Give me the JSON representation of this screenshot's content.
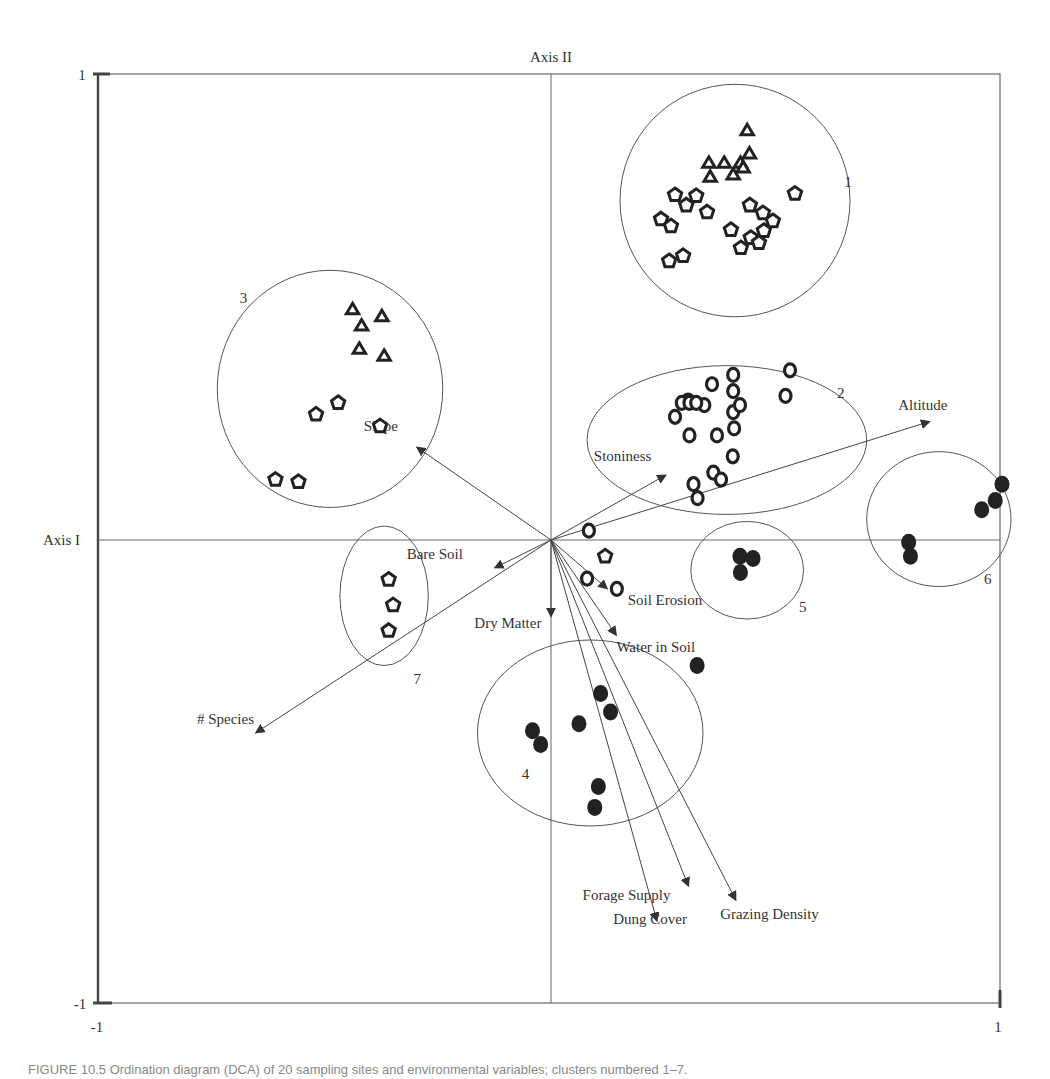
{
  "chart_data": {
    "type": "scatter",
    "title": "",
    "xlabel": "Axis I",
    "ylabel": "Axis II",
    "xlim": [
      -1,
      1
    ],
    "ylim": [
      -1,
      1
    ],
    "grid": false,
    "legend": "none",
    "tick_labels": {
      "x_min": "-1",
      "x_max": "1",
      "y_min": "-1",
      "y_max": "1"
    },
    "series": [
      {
        "name": "triangle",
        "marker": "triangle-open",
        "points": [
          [
            0.435,
            0.88
          ],
          [
            0.44,
            0.83
          ],
          [
            0.35,
            0.81
          ],
          [
            0.384,
            0.81
          ],
          [
            0.42,
            0.81
          ],
          [
            0.353,
            0.78
          ],
          [
            0.404,
            0.785
          ],
          [
            0.426,
            0.8
          ],
          [
            -0.44,
            0.495
          ],
          [
            -0.42,
            0.46
          ],
          [
            -0.375,
            0.48
          ],
          [
            -0.425,
            0.41
          ],
          [
            -0.37,
            0.395
          ]
        ]
      },
      {
        "name": "pentagon",
        "marker": "pentagon-open",
        "points": [
          [
            0.275,
            0.742
          ],
          [
            0.322,
            0.74
          ],
          [
            0.3,
            0.72
          ],
          [
            0.244,
            0.69
          ],
          [
            0.266,
            0.675
          ],
          [
            0.346,
            0.705
          ],
          [
            0.441,
            0.72
          ],
          [
            0.47,
            0.703
          ],
          [
            0.492,
            0.686
          ],
          [
            0.399,
            0.667
          ],
          [
            0.472,
            0.665
          ],
          [
            0.443,
            0.65
          ],
          [
            0.461,
            0.639
          ],
          [
            0.421,
            0.628
          ],
          [
            0.262,
            0.6
          ],
          [
            0.293,
            0.611
          ],
          [
            0.541,
            0.745
          ],
          [
            -0.521,
            0.27
          ],
          [
            -0.472,
            0.295
          ],
          [
            -0.379,
            0.245
          ],
          [
            -0.56,
            0.125
          ],
          [
            -0.611,
            0.13
          ],
          [
            0.12,
            -0.035
          ],
          [
            -0.36,
            -0.085
          ],
          [
            -0.35,
            -0.14
          ],
          [
            -0.36,
            -0.195
          ]
        ]
      },
      {
        "name": "circle",
        "marker": "circle-open",
        "points": [
          [
            0.304,
            0.3
          ],
          [
            0.357,
            0.335
          ],
          [
            0.34,
            0.29
          ],
          [
            0.275,
            0.265
          ],
          [
            0.29,
            0.295
          ],
          [
            0.307,
            0.295
          ],
          [
            0.322,
            0.295
          ],
          [
            0.307,
            0.225
          ],
          [
            0.368,
            0.225
          ],
          [
            0.406,
            0.24
          ],
          [
            0.404,
            0.275
          ],
          [
            0.419,
            0.29
          ],
          [
            0.404,
            0.32
          ],
          [
            0.404,
            0.355
          ],
          [
            0.52,
            0.31
          ],
          [
            0.53,
            0.365
          ],
          [
            0.403,
            0.18
          ],
          [
            0.36,
            0.145
          ],
          [
            0.377,
            0.13
          ],
          [
            0.316,
            0.12
          ],
          [
            0.325,
            0.09
          ],
          [
            0.084,
            0.02
          ],
          [
            0.08,
            -0.083
          ],
          [
            0.146,
            -0.105
          ]
        ]
      },
      {
        "name": "filled-circle",
        "marker": "circle-filled",
        "points": [
          [
            0.419,
            -0.035
          ],
          [
            0.448,
            -0.04
          ],
          [
            0.42,
            -0.07
          ],
          [
            1.0,
            0.12
          ],
          [
            0.985,
            0.085
          ],
          [
            0.955,
            0.065
          ],
          [
            0.793,
            -0.005
          ],
          [
            0.797,
            -0.035
          ],
          [
            0.324,
            -0.27
          ],
          [
            0.11,
            -0.33
          ],
          [
            0.132,
            -0.37
          ],
          [
            -0.041,
            -0.41
          ],
          [
            -0.023,
            -0.44
          ],
          [
            0.062,
            -0.395
          ],
          [
            0.105,
            -0.53
          ],
          [
            0.097,
            -0.575
          ]
        ]
      }
    ],
    "vectors": [
      {
        "label": "Altitude",
        "end": [
          0.84,
          0.255
        ],
        "label_pos": [
          0.77,
          0.28
        ]
      },
      {
        "label": "Stoniness",
        "end": [
          0.255,
          0.14
        ],
        "label_pos": [
          0.095,
          0.17
        ]
      },
      {
        "label": "Slope",
        "end": [
          -0.298,
          0.2
        ],
        "label_pos": [
          -0.415,
          0.235
        ]
      },
      {
        "label": "Bare Soil",
        "end": [
          -0.125,
          -0.06
        ],
        "label_pos": [
          -0.32,
          -0.04
        ]
      },
      {
        "label": "# Species",
        "end": [
          -0.655,
          -0.415
        ],
        "label_pos": [
          -0.785,
          -0.395
        ]
      },
      {
        "label": "Dry Matter",
        "end": [
          0.0,
          -0.165
        ],
        "label_pos": [
          -0.17,
          -0.19
        ]
      },
      {
        "label": "Soil Erosion",
        "end": [
          0.125,
          -0.105
        ],
        "label_pos": [
          0.17,
          -0.14
        ]
      },
      {
        "label": "Water in Soil",
        "end": [
          0.145,
          -0.205
        ],
        "label_pos": [
          0.145,
          -0.24
        ]
      },
      {
        "label": "Forage Supply",
        "end": [
          0.305,
          -0.745
        ],
        "label_pos": [
          0.07,
          -0.775
        ]
      },
      {
        "label": "Dung Cover",
        "end": [
          0.235,
          -0.82
        ],
        "label_pos": [
          0.138,
          -0.825
        ]
      },
      {
        "label": "Grazing Density",
        "end": [
          0.41,
          -0.775
        ],
        "label_pos": [
          0.375,
          -0.815
        ]
      }
    ],
    "clusters": [
      {
        "label": "1",
        "center": [
          0.408,
          0.73
        ],
        "rx": 0.255,
        "ry": 0.25,
        "label_pos": [
          0.65,
          0.76
        ]
      },
      {
        "label": "2",
        "center": [
          0.39,
          0.215
        ],
        "rx": 0.31,
        "ry": 0.16,
        "label_pos": [
          0.634,
          0.305
        ]
      },
      {
        "label": "3",
        "center": [
          -0.49,
          0.325
        ],
        "rx": 0.25,
        "ry": 0.255,
        "label_pos": [
          -0.69,
          0.51
        ]
      },
      {
        "label": "4",
        "center": [
          0.087,
          -0.415
        ],
        "rx": 0.25,
        "ry": 0.2,
        "label_pos": [
          -0.065,
          -0.515
        ]
      },
      {
        "label": "5",
        "center": [
          0.435,
          -0.065
        ],
        "rx": 0.125,
        "ry": 0.105,
        "label_pos": [
          0.55,
          -0.155
        ]
      },
      {
        "label": "6",
        "center": [
          0.86,
          0.045
        ],
        "rx": 0.16,
        "ry": 0.145,
        "label_pos": [
          0.96,
          -0.095
        ]
      },
      {
        "label": "7",
        "center": [
          -0.37,
          -0.12
        ],
        "rx": 0.098,
        "ry": 0.15,
        "label_pos": [
          -0.305,
          -0.31
        ]
      }
    ]
  },
  "axis_labels": {
    "x": "Axis I",
    "y": "Axis II"
  },
  "caption": "FIGURE 10.5  Ordination diagram (DCA) of 20 sampling sites and environmental variables; clusters numbered 1–7."
}
